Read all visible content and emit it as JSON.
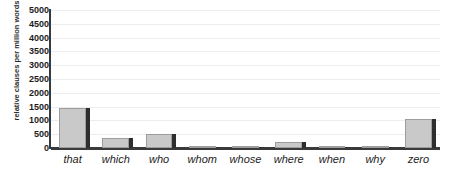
{
  "chart_data": {
    "type": "bar",
    "title": "",
    "xlabel": "",
    "ylabel": "relative clauses per million words",
    "categories": [
      "that",
      "which",
      "who",
      "whom",
      "whose",
      "where",
      "when",
      "why",
      "zero"
    ],
    "values": [
      1450,
      360,
      500,
      10,
      15,
      220,
      40,
      30,
      1050
    ],
    "ylim": [
      0,
      5000
    ],
    "ytick_step": 500,
    "yticks": [
      0,
      500,
      1000,
      1500,
      2000,
      2500,
      3000,
      3500,
      4000,
      4500,
      5000
    ],
    "ytick_labels": [
      "0",
      "500",
      "1000",
      "1500",
      "2000",
      "2500",
      "3000",
      "3500",
      "4000",
      "4500",
      "5000"
    ],
    "grid": true,
    "legend": false,
    "legend_position": "none",
    "bar_color": "#c9c9c9",
    "bar_edge_color": "#9d9d9d",
    "bar_shadow_color": "#2e2e2e",
    "gridline_color": "#ededed",
    "axis_color": "#3a3a3a",
    "text_color": "#1c1c1c",
    "xtick_style": "italic"
  }
}
